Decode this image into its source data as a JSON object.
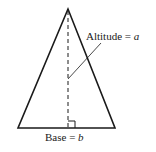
{
  "diagram": {
    "type": "triangle-area-figure",
    "altitude_label": "Altitude = ",
    "altitude_var": "a",
    "base_label": "Base = ",
    "base_var": "b",
    "colors": {
      "stroke": "#1a1a1a",
      "background": "#ffffff"
    }
  }
}
